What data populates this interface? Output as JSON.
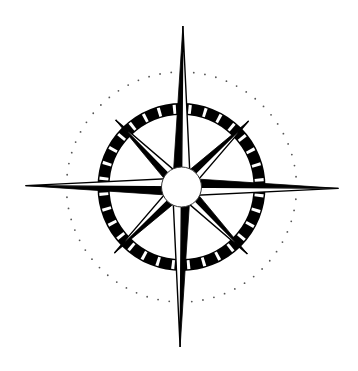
{
  "image": {
    "subject": "compass rose",
    "width": 358,
    "height": 371,
    "background": "#ffffff"
  },
  "compass": {
    "center": [
      181.5,
      187
    ],
    "rotation_deg": 0.5,
    "colors": {
      "ink": "#000000",
      "paper": "#ffffff",
      "dots": "#555555"
    },
    "dotted_circle": {
      "radius": 115,
      "dot_count": 64,
      "dot_radius": 0.9
    },
    "ring": {
      "outer_radius": 84,
      "inner_radius": 72,
      "tick_count": 32,
      "tick_width_deg": 2.2
    },
    "center_circle": {
      "radius": 20
    },
    "cardinal_points": [
      {
        "name": "north",
        "angle": -90,
        "length": 161,
        "half_width": 9
      },
      {
        "name": "east",
        "angle": 0,
        "length": 157,
        "half_width": 9
      },
      {
        "name": "south",
        "angle": 90,
        "length": 160,
        "half_width": 9
      },
      {
        "name": "west",
        "angle": 180,
        "length": 156,
        "half_width": 9
      }
    ],
    "intercardinal_points": [
      {
        "name": "northeast",
        "angle": -45,
        "length": 94,
        "half_width": 8
      },
      {
        "name": "southeast",
        "angle": 45,
        "length": 94,
        "half_width": 8
      },
      {
        "name": "southwest",
        "angle": 135,
        "length": 94,
        "half_width": 8
      },
      {
        "name": "northwest",
        "angle": -135,
        "length": 94,
        "half_width": 8
      }
    ]
  }
}
